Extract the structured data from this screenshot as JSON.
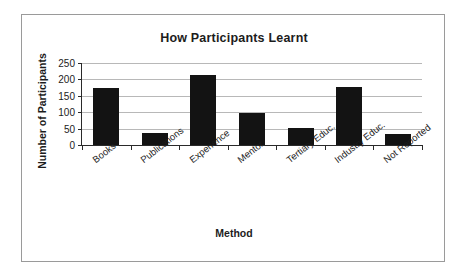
{
  "chart_data": {
    "type": "bar",
    "title": "How Participants Learnt",
    "xlabel": "Method",
    "ylabel": "Number of Participants",
    "categories": [
      "Books",
      "Publications",
      "Experience",
      "Mentor",
      "Tertiary Educ.",
      "Industry Educ.",
      "Not Reported"
    ],
    "values": [
      173,
      37,
      212,
      97,
      52,
      177,
      34
    ],
    "ylim": [
      0,
      250
    ],
    "yticks": [
      0,
      50,
      100,
      150,
      200,
      250
    ],
    "ytick_labels": [
      "0",
      "50",
      "100",
      "150",
      "200",
      "250"
    ],
    "grid": true,
    "legend": false,
    "bar_color": "#131313",
    "series": [
      {
        "name": "Number of Participants",
        "values": [
          173,
          37,
          212,
          97,
          52,
          177,
          34
        ]
      }
    ]
  },
  "figure": {
    "border_color": "#9a9a9a",
    "background": "#ffffff",
    "axis_color": "#2a2a2a",
    "gridline_color": "#b8b8b8"
  }
}
